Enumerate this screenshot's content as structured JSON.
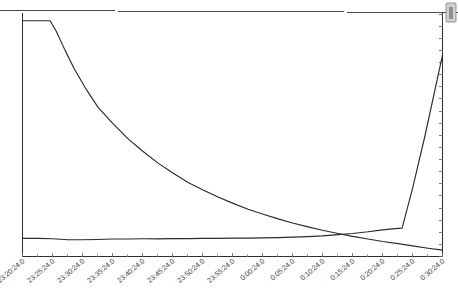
{
  "chart_data": {
    "type": "line",
    "title": "",
    "subtitle": "",
    "xlabel": "",
    "ylabel": "",
    "grid": false,
    "legend_position": "none",
    "xlim": [
      "23:20:24.0",
      "0:30:24.0"
    ],
    "ylim": [
      0,
      100
    ],
    "x_tick_labels": [
      "23:20:24.0",
      "23:25:24.0",
      "23:30:24.0",
      "23:35:24.0",
      "23:40:24.0",
      "23:45:24.0",
      "23:50:24.0",
      "23:55:24.0",
      "0:00:24.0",
      "0:05:24.0",
      "0:10:24.0",
      "0:15:24.0",
      "0:20:24.0",
      "0:25:24.0",
      "0:30:24.0"
    ],
    "x_minor_ticks_per_interval": 1,
    "y_tick_labels": [],
    "y_axis_side": "right",
    "y_right_tick_count": 21,
    "series": [
      {
        "name": "decay-series",
        "color": "#2b2b2b",
        "x": [
          "23:20:24.0",
          "23:22:00.0",
          "23:23:30.0",
          "23:25:00.0",
          "23:26:00.0",
          "23:27:30.0",
          "23:29:00.0",
          "23:31:00.0",
          "23:33:00.0",
          "23:35:24.0",
          "23:38:00.0",
          "23:40:24.0",
          "23:43:00.0",
          "23:45:24.0",
          "23:48:00.0",
          "23:50:24.0",
          "23:53:00.0",
          "23:55:24.0",
          "23:58:00.0",
          "0:00:24.0",
          "0:03:00.0",
          "0:05:24.0",
          "0:08:00.0",
          "0:10:24.0",
          "0:13:00.0",
          "0:15:24.0",
          "0:18:00.0",
          "0:20:24.0",
          "0:23:00.0",
          "0:25:24.0",
          "0:28:00.0",
          "0:30:24.0"
        ],
        "values": [
          97.2,
          97.2,
          97.2,
          97.2,
          93.0,
          85.0,
          77.5,
          69.0,
          61.5,
          55.0,
          48.5,
          43.5,
          38.5,
          34.5,
          30.5,
          27.5,
          24.5,
          22.0,
          19.5,
          17.5,
          15.5,
          13.8,
          12.2,
          10.8,
          9.5,
          8.3,
          7.2,
          6.2,
          5.3,
          4.4,
          3.4,
          2.6
        ]
      },
      {
        "name": "rise-series",
        "color": "#2b2b2b",
        "x": [
          "23:20:24.0",
          "23:23:00.0",
          "23:25:24.0",
          "23:28:00.0",
          "23:30:24.0",
          "23:33:00.0",
          "23:35:24.0",
          "23:38:00.0",
          "23:40:24.0",
          "23:43:00.0",
          "23:45:24.0",
          "23:48:00.0",
          "23:50:24.0",
          "23:53:00.0",
          "23:55:24.0",
          "23:58:00.0",
          "0:00:24.0",
          "0:03:00.0",
          "0:05:24.0",
          "0:08:00.0",
          "0:10:24.0",
          "0:13:00.0",
          "0:15:24.0",
          "0:18:00.0",
          "0:20:24.0",
          "0:22:30.0",
          "0:23:40.0",
          "0:25:24.0",
          "0:27:30.0",
          "0:30:24.0"
        ],
        "values": [
          7.5,
          7.5,
          7.3,
          6.9,
          6.9,
          7.0,
          7.2,
          7.2,
          7.3,
          7.3,
          7.4,
          7.4,
          7.5,
          7.5,
          7.6,
          7.6,
          7.7,
          7.8,
          8.0,
          8.2,
          8.5,
          9.0,
          9.5,
          10.2,
          11.0,
          11.5,
          11.7,
          28.0,
          50.0,
          83.0
        ]
      }
    ],
    "annotations": []
  },
  "widgets": {
    "scrollbar_thumb_name": "vertical-scrollbar-thumb"
  }
}
